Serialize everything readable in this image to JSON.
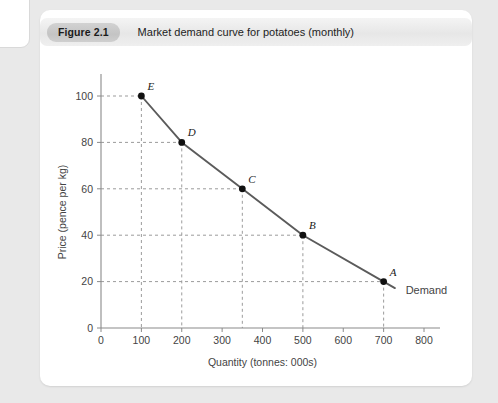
{
  "figure": {
    "badge": "Figure 2.1",
    "title": "Market demand curve for potatoes (monthly)"
  },
  "chart_data": {
    "type": "line",
    "title": "Market demand curve for potatoes (monthly)",
    "xlabel": "Quantity (tonnes: 000s)",
    "ylabel": "Price (pence per kg)",
    "xlim": [
      0,
      800
    ],
    "ylim": [
      0,
      100
    ],
    "xticks": [
      0,
      100,
      200,
      300,
      400,
      500,
      600,
      700,
      800
    ],
    "xtick_labels": [
      "0",
      "100",
      "200",
      "300",
      "400",
      "500",
      "600",
      "700",
      "800"
    ],
    "yticks": [
      0,
      20,
      40,
      60,
      80,
      100
    ],
    "ytick_labels": [
      "0",
      "20",
      "40",
      "60",
      "80",
      "100"
    ],
    "grid": "dashed-to-points",
    "legend": "inline-annotation",
    "series": [
      {
        "name": "Demand",
        "label": "Demand",
        "color": "#5b5b5b",
        "points": [
          {
            "label": "E",
            "x": 100,
            "y": 100
          },
          {
            "label": "D",
            "x": 200,
            "y": 80
          },
          {
            "label": "C",
            "x": 350,
            "y": 60
          },
          {
            "label": "B",
            "x": 500,
            "y": 40
          },
          {
            "label": "A",
            "x": 700,
            "y": 20
          }
        ]
      }
    ]
  }
}
